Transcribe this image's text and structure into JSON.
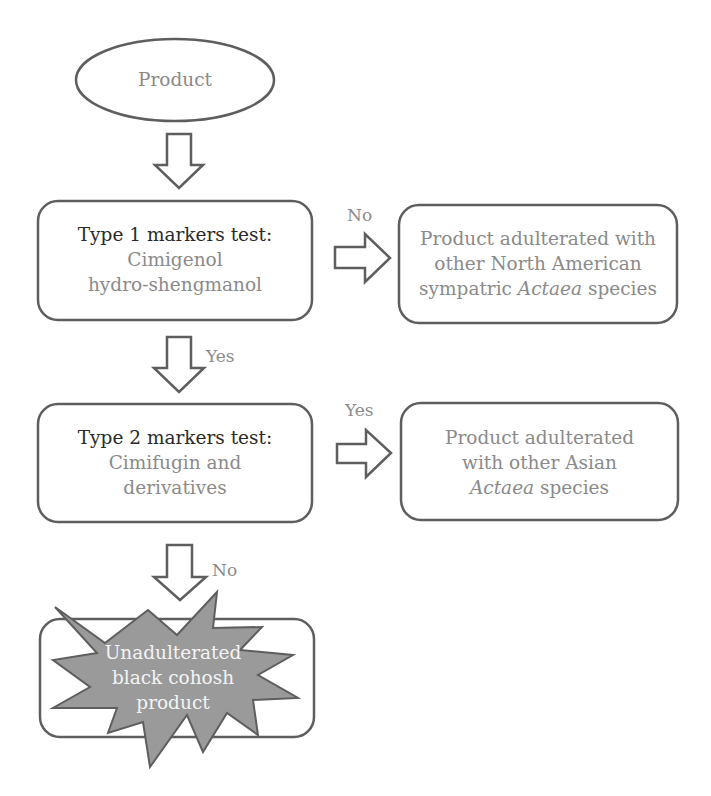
{
  "colors": {
    "stroke": "#5e5e5e",
    "text_dark": "#2a2a2a",
    "text_gray": "#8a8a8a",
    "starburst_fill": "#9a9a9a",
    "starburst_text": "#f4f4f4",
    "background": "#ffffff"
  },
  "nodes": {
    "start": {
      "label": "Product",
      "shape": "ellipse"
    },
    "test1": {
      "title": "Type 1 markers test:",
      "line1": "Cimigenol",
      "line2": "hydro-shengmanol",
      "shape": "rounded-rect"
    },
    "result1": {
      "line1": "Product adulterated with",
      "line2": "other North American",
      "line3_prefix": "sympatric ",
      "line3_italic": "Actaea",
      "line3_suffix": " species",
      "shape": "rounded-rect"
    },
    "test2": {
      "title": "Type 2 markers test:",
      "line1": "Cimifugin and",
      "line2": "derivatives",
      "shape": "rounded-rect"
    },
    "result2": {
      "line1": "Product adulterated",
      "line2": "with other Asian",
      "line3_italic": "Actaea",
      "line3_suffix": " species",
      "shape": "rounded-rect"
    },
    "final": {
      "line1": "Unadulterated",
      "line2": "black cohosh",
      "line3": "product",
      "shape": "starburst-in-rounded-rect"
    }
  },
  "edges": [
    {
      "from": "start",
      "to": "test1",
      "label": ""
    },
    {
      "from": "test1",
      "to": "result1",
      "label": "No"
    },
    {
      "from": "test1",
      "to": "test2",
      "label": "Yes"
    },
    {
      "from": "test2",
      "to": "result2",
      "label": "Yes"
    },
    {
      "from": "test2",
      "to": "final",
      "label": "No"
    }
  ]
}
